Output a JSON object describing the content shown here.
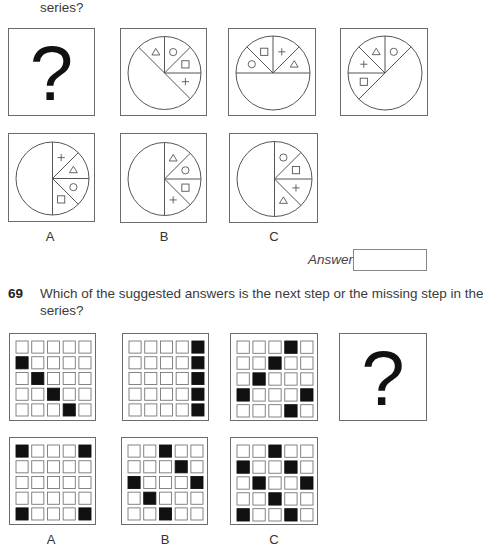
{
  "q68": {
    "question_tail": "series?",
    "series": [
      {
        "type": "question",
        "symbol": "?"
      },
      {
        "type": "pie",
        "rotation": 45,
        "shapes": [
          "triangle",
          "circle",
          "square",
          "plus"
        ]
      },
      {
        "type": "pie",
        "rotation": 90,
        "shapes": [
          "circle",
          "square",
          "plus",
          "triangle"
        ]
      },
      {
        "type": "pie",
        "rotation": 135,
        "shapes": [
          "square",
          "plus",
          "triangle",
          "circle"
        ]
      }
    ],
    "options": [
      {
        "label": "A",
        "rotation": 0,
        "shapes": [
          "plus",
          "triangle",
          "circle",
          "square"
        ]
      },
      {
        "label": "B",
        "rotation": 0,
        "shapes": [
          "triangle",
          "circle",
          "square",
          "plus"
        ]
      },
      {
        "label": "C",
        "rotation": 0,
        "shapes": [
          "circle",
          "square",
          "plus",
          "triangle"
        ]
      }
    ],
    "answer_label": "Answer",
    "answer_value": ""
  },
  "q69": {
    "number": "69",
    "question_line1": "Which of the suggested answers is the next step or the missing step in the",
    "question_line2": "series?",
    "series": [
      {
        "type": "grid",
        "filled": [
          [
            1,
            0
          ],
          [
            2,
            1
          ],
          [
            3,
            2
          ],
          [
            4,
            3
          ]
        ]
      },
      {
        "type": "grid",
        "filled": [
          [
            0,
            4
          ],
          [
            1,
            4
          ],
          [
            2,
            4
          ],
          [
            3,
            4
          ],
          [
            4,
            4
          ]
        ]
      },
      {
        "type": "grid",
        "filled": [
          [
            0,
            3
          ],
          [
            1,
            2
          ],
          [
            2,
            1
          ],
          [
            3,
            0
          ],
          [
            3,
            4
          ],
          [
            4,
            3
          ]
        ]
      },
      {
        "type": "question",
        "symbol": "?"
      }
    ],
    "options": [
      {
        "label": "A",
        "filled": [
          [
            0,
            0
          ],
          [
            0,
            4
          ],
          [
            4,
            0
          ],
          [
            4,
            4
          ]
        ]
      },
      {
        "label": "B",
        "filled": [
          [
            0,
            2
          ],
          [
            1,
            3
          ],
          [
            2,
            0
          ],
          [
            2,
            4
          ],
          [
            3,
            1
          ],
          [
            4,
            2
          ]
        ]
      },
      {
        "label": "C",
        "filled": [
          [
            0,
            2
          ],
          [
            1,
            0
          ],
          [
            1,
            3
          ],
          [
            2,
            1
          ],
          [
            2,
            4
          ],
          [
            3,
            2
          ],
          [
            4,
            0
          ],
          [
            4,
            3
          ]
        ]
      }
    ]
  }
}
